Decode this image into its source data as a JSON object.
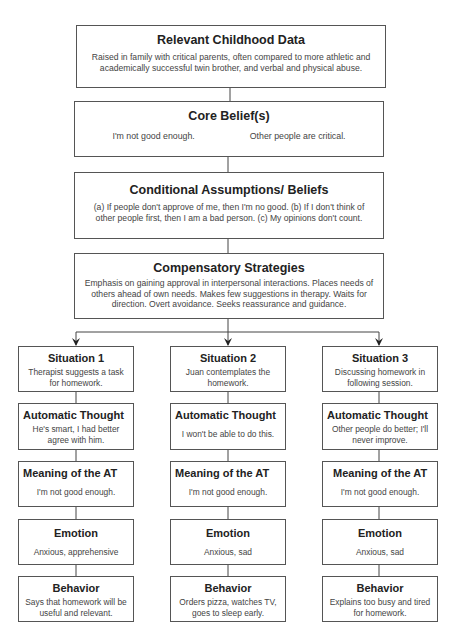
{
  "childhood": {
    "title": "Relevant Childhood Data",
    "body": "Raised in family with critical parents, often compared to more athletic and academically successful twin brother, and verbal and physical abuse."
  },
  "core_beliefs": {
    "title": "Core Belief(s)",
    "items": [
      "I'm not good enough.",
      "Other people are critical."
    ]
  },
  "conditional": {
    "title": "Conditional Assumptions/ Beliefs",
    "body": "(a) If people don't approve of me, then I'm no good. (b) If I don't think of other people first, then I am a bad person. (c) My opinions don't count."
  },
  "compensatory": {
    "title": "Compensatory Strategies",
    "body": "Emphasis on gaining approval in interpersonal interactions. Places needs of others ahead of own needs. Makes few suggestions in therapy.  Waits for direction. Overt avoidance. Seeks reassurance and guidance."
  },
  "situations": [
    {
      "situation": {
        "title": "Situation 1",
        "body": "Therapist suggests a task for homework."
      },
      "automatic_thought": {
        "title": "Automatic Thought",
        "body": "He's smart, I had better agree with him."
      },
      "meaning": {
        "title": "Meaning of the AT",
        "body": "I'm not good enough."
      },
      "emotion": {
        "title": "Emotion",
        "body": "Anxious, apprehensive"
      },
      "behavior": {
        "title": "Behavior",
        "body": "Says that homework will be useful and relevant."
      }
    },
    {
      "situation": {
        "title": "Situation 2",
        "body": "Juan contemplates the homework."
      },
      "automatic_thought": {
        "title": "Automatic Thought",
        "body": "I won't be able to do this."
      },
      "meaning": {
        "title": "Meaning of the AT",
        "body": "I'm not good enough."
      },
      "emotion": {
        "title": "Emotion",
        "body": "Anxious, sad"
      },
      "behavior": {
        "title": "Behavior",
        "body": "Orders pizza, watches TV, goes to sleep early."
      }
    },
    {
      "situation": {
        "title": "Situation 3",
        "body": "Discussing homework in following session."
      },
      "automatic_thought": {
        "title": "Automatic Thought",
        "body": "Other people do better; I'll never improve."
      },
      "meaning": {
        "title": "Meaning of the AT",
        "body": "I'm not good enough."
      },
      "emotion": {
        "title": "Emotion",
        "body": "Anxious, sad"
      },
      "behavior": {
        "title": "Behavior",
        "body": "Explains too busy and tired for homework."
      }
    }
  ]
}
